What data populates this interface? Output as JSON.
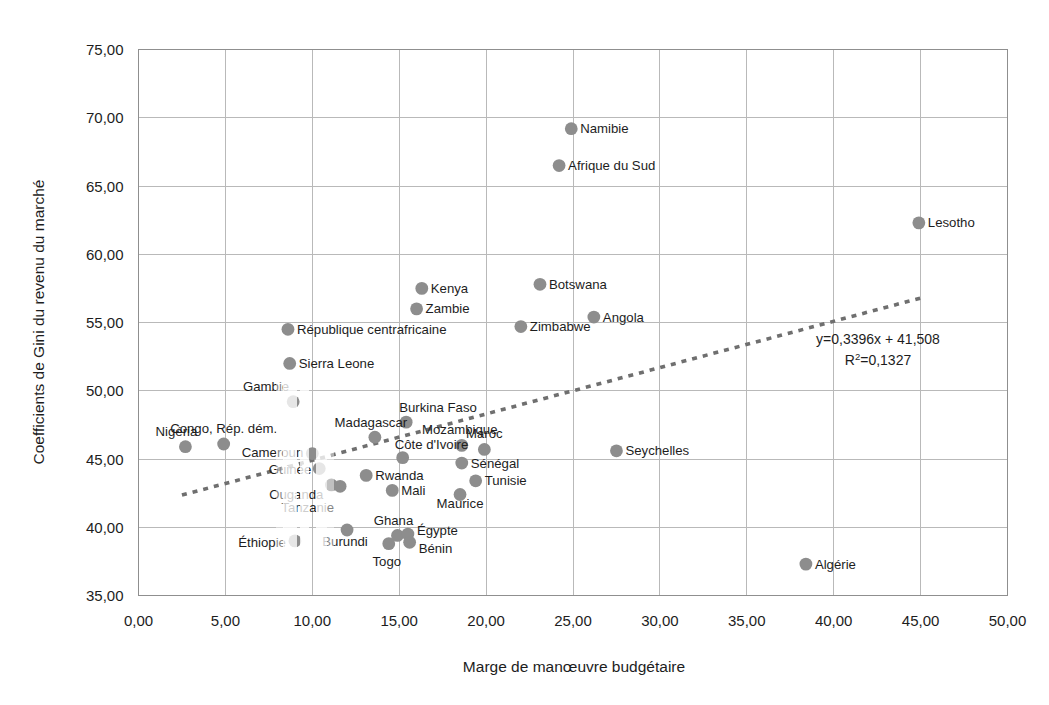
{
  "chart_data": {
    "type": "scatter",
    "title": "",
    "xlabel": "Marge de manœuvre budgétaire",
    "ylabel": "Coefficients de Gini du revenu du marché",
    "xlim": [
      0,
      50
    ],
    "ylim": [
      35,
      75
    ],
    "xticks": [
      "0,00",
      "5,00",
      "10,00",
      "15,00",
      "20,00",
      "25,00",
      "30,00",
      "35,00",
      "40,00",
      "45,00",
      "50,00"
    ],
    "yticks": [
      "35,00",
      "40,00",
      "45,00",
      "50,00",
      "55,00",
      "60,00",
      "65,00",
      "70,00",
      "75,00"
    ],
    "grid": true,
    "legend": "none",
    "point_color": "#8d8d8d",
    "trendline": {
      "equation": "y=0,3396x + 41,508",
      "r_squared_prefix": "R",
      "r_squared_sup": "2",
      "r_squared_value": "=0,1327",
      "slope": 0.3396,
      "intercept": 41.508,
      "r2": 0.1327,
      "style": "dotted",
      "color": "#6f6f6f"
    },
    "points": [
      {
        "name": "Namibie",
        "x": 24.9,
        "y": 69.2,
        "label_dx": 9,
        "label_dy": 4.5,
        "anchor": "start"
      },
      {
        "name": "Afrique du Sud",
        "x": 24.2,
        "y": 66.5,
        "label_dx": 9,
        "label_dy": 4.5,
        "anchor": "start"
      },
      {
        "name": "Lesotho",
        "x": 44.9,
        "y": 62.3,
        "label_dx": 9,
        "label_dy": 4.5,
        "anchor": "start"
      },
      {
        "name": "Kenya",
        "x": 16.3,
        "y": 57.5,
        "label_dx": 9,
        "label_dy": 4.5,
        "anchor": "start"
      },
      {
        "name": "Botswana",
        "x": 23.1,
        "y": 57.8,
        "label_dx": 9,
        "label_dy": 4.5,
        "anchor": "start"
      },
      {
        "name": "Zambie",
        "x": 16.0,
        "y": 56.0,
        "label_dx": 9,
        "label_dy": 4.5,
        "anchor": "start"
      },
      {
        "name": "Angola",
        "x": 26.2,
        "y": 55.4,
        "label_dx": 9,
        "label_dy": 4.5,
        "anchor": "start"
      },
      {
        "name": "Zimbabwe",
        "x": 22.0,
        "y": 54.7,
        "label_dx": 9,
        "label_dy": 4.5,
        "anchor": "start"
      },
      {
        "name": "République centrafricaine",
        "x": 8.6,
        "y": 54.5,
        "label_dx": 9,
        "label_dy": 4.5,
        "anchor": "start"
      },
      {
        "name": "Sierra Leone",
        "x": 8.7,
        "y": 52.0,
        "label_dx": 9,
        "label_dy": 4.5,
        "anchor": "start"
      },
      {
        "name": "Gambie",
        "x": 8.9,
        "y": 49.2,
        "label_dx": -4,
        "label_dy": -11,
        "anchor": "end"
      },
      {
        "name": "Burkina Faso",
        "x": 15.4,
        "y": 47.7,
        "label_dx": -7,
        "label_dy": -10,
        "anchor": "start"
      },
      {
        "name": "Nigéria",
        "x": 2.7,
        "y": 45.9,
        "label_dx": -9,
        "label_dy": -11,
        "anchor": "middle"
      },
      {
        "name": "Congo, Rép. dém.",
        "x": 4.9,
        "y": 46.1,
        "label_dx": 0,
        "label_dy": -11,
        "anchor": "middle"
      },
      {
        "name": "Madagascar",
        "x": 13.6,
        "y": 46.6,
        "label_dx": -4,
        "label_dy": -10,
        "anchor": "middle"
      },
      {
        "name": "Mozambique",
        "x": 18.6,
        "y": 46.0,
        "label_dx": -2,
        "label_dy": -11,
        "anchor": "middle"
      },
      {
        "name": "Maroc",
        "x": 19.9,
        "y": 45.7,
        "label_dx": 0,
        "label_dy": -11,
        "anchor": "middle"
      },
      {
        "name": "Seychelles",
        "x": 27.5,
        "y": 45.6,
        "label_dx": 9,
        "label_dy": 4.5,
        "anchor": "start"
      },
      {
        "name": "Cameroun",
        "x": 10.0,
        "y": 45.4,
        "label_dx": -9,
        "label_dy": 3,
        "anchor": "end"
      },
      {
        "name": "Côte d'Ivoire",
        "x": 15.2,
        "y": 45.1,
        "label_dx": -8,
        "label_dy": -9,
        "anchor": "start"
      },
      {
        "name": "Sénégal",
        "x": 18.6,
        "y": 44.7,
        "label_dx": 9,
        "label_dy": 4.5,
        "anchor": "start"
      },
      {
        "name": "Guinée",
        "x": 10.4,
        "y": 44.3,
        "label_dx": -8,
        "label_dy": 5,
        "anchor": "end"
      },
      {
        "name": "Rwanda",
        "x": 13.1,
        "y": 43.8,
        "label_dx": 9,
        "label_dy": 4.5,
        "anchor": "start"
      },
      {
        "name": "Tunisie",
        "x": 19.4,
        "y": 43.4,
        "label_dx": 9,
        "label_dy": 4.5,
        "anchor": "start"
      },
      {
        "name": "Mali",
        "x": 14.6,
        "y": 42.7,
        "label_dx": 9,
        "label_dy": 4.5,
        "anchor": "start"
      },
      {
        "name": "Maurice",
        "x": 18.5,
        "y": 42.4,
        "label_dx": 0,
        "label_dy": 14,
        "anchor": "middle"
      },
      {
        "name": "Ouganda",
        "x": 11.1,
        "y": 43.1,
        "label_dx": -8,
        "label_dy": 14,
        "anchor": "end"
      },
      {
        "name": "Tanzanie",
        "x": 11.6,
        "y": 43.0,
        "label_dx": -6,
        "label_dy": 26,
        "anchor": "end"
      },
      {
        "name": "Burundi",
        "x": 12.0,
        "y": 39.8,
        "label_dx": -2,
        "label_dy": 16,
        "anchor": "middle"
      },
      {
        "name": "Ghana",
        "x": 14.9,
        "y": 39.4,
        "label_dx": -4,
        "label_dy": -10,
        "anchor": "middle"
      },
      {
        "name": "Éthiopie",
        "x": 9.0,
        "y": 39.0,
        "label_dx": -9,
        "label_dy": 6,
        "anchor": "end"
      },
      {
        "name": "Égypte",
        "x": 15.5,
        "y": 39.5,
        "label_dx": 9,
        "label_dy": 1,
        "anchor": "start"
      },
      {
        "name": "Bénin",
        "x": 15.6,
        "y": 38.9,
        "label_dx": 9,
        "label_dy": 11,
        "anchor": "start"
      },
      {
        "name": "Togo",
        "x": 14.4,
        "y": 38.8,
        "label_dx": -2,
        "label_dy": 22,
        "anchor": "middle"
      },
      {
        "name": "Algérie",
        "x": 38.4,
        "y": 37.3,
        "label_dx": 9,
        "label_dy": 4.5,
        "anchor": "start"
      }
    ]
  }
}
